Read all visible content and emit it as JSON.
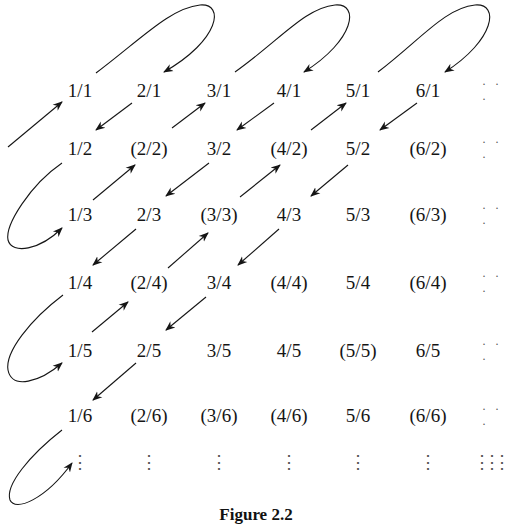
{
  "figure": {
    "caption": "Figure 2.2",
    "columns_x": [
      80,
      149,
      219,
      289,
      358,
      428
    ],
    "rows_y": [
      90,
      148,
      214,
      282,
      350,
      415
    ],
    "ellipsis_col_x": 492,
    "vertical_dots_y": 462,
    "rows": [
      [
        "1/1",
        "2/1",
        "3/1",
        "4/1",
        "5/1",
        "6/1"
      ],
      [
        "1/2",
        "(2/2)",
        "3/2",
        "(4/2)",
        "5/2",
        "(6/2)"
      ],
      [
        "1/3",
        "2/3",
        "(3/3)",
        "4/3",
        "5/3",
        "(6/3)"
      ],
      [
        "1/4",
        "(2/4)",
        "3/4",
        "(4/4)",
        "5/4",
        "(6/4)"
      ],
      [
        "1/5",
        "2/5",
        "3/5",
        "4/5",
        "(5/5)",
        "6/5"
      ],
      [
        "1/6",
        "(2/6)",
        "(3/6)",
        "(4/6)",
        "5/6",
        "(6/6)"
      ]
    ],
    "row_ellipsis": "· · ·",
    "col_ellipsis": "⋮",
    "ink_color": "#151515"
  }
}
